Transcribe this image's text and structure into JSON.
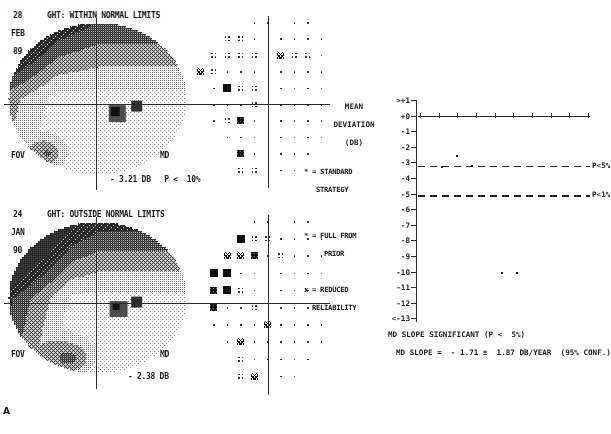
{
  "figure": {
    "panel_label": "A",
    "caption": ""
  },
  "reports": [
    {
      "id": "report-top",
      "day": "28",
      "month": "FEB",
      "year": "89",
      "ght_label": "GHT:",
      "ght_result": "WITHIN NORMAL LIMITS",
      "ght_full": "GHT: WITHIN NORMAL LIMITS",
      "fov_label": "FOV",
      "md_label": "MD",
      "md_value": "- 3.21 DB",
      "md_p": "P <  10%",
      "md_line": "- 3.21 DB   P <  10%"
    },
    {
      "id": "report-bottom",
      "day": "24",
      "month": "JAN",
      "year": "90",
      "ght_label": "GHT:",
      "ght_result": "OUTSIDE NORMAL LIMITS",
      "ght_full": "GHT: OUTSIDE NORMAL LIMITS",
      "fov_label": "FOV",
      "md_label": "MD",
      "md_value": "- 2.38 DB",
      "md_p": "",
      "md_line": "- 2.38 DB"
    }
  ],
  "legend": {
    "items": [
      {
        "symbol": "*",
        "text": "* = STANDARD",
        "text2": "STRATEGY"
      },
      {
        "symbol": "*",
        "text": "* = FULL FROM",
        "text2": "PRIOR"
      },
      {
        "symbol": "x",
        "text": "x = REDUCED",
        "text2": "RELIABILITY"
      }
    ]
  },
  "chart_data": {
    "type": "scatter",
    "title": "MEAN DEVIATION (DB)",
    "title_lines": [
      "MEAN",
      "DEVIATION",
      "(DB)"
    ],
    "ylabel": "MEAN DEVIATION (DB)",
    "xlabel": "",
    "ytick_labels": [
      ">+1",
      "+0",
      "-1",
      "-2",
      "-3",
      "-4",
      "-5",
      "-6",
      "-7",
      "-8",
      "-9",
      "-10",
      "-11",
      "-12",
      "<-13"
    ],
    "ylim": [
      -13,
      1
    ],
    "grid": false,
    "legend_position": "right",
    "reference_lines": [
      {
        "label": "P<5%",
        "value": -3.2,
        "style": "dashed"
      },
      {
        "label": "P<1%",
        "value": -5.1,
        "style": "dashed"
      }
    ],
    "baseline": {
      "label": "",
      "value": 0,
      "style": "solid-with-ticks",
      "tick_count": 10
    },
    "series": [
      {
        "name": "mean deviation",
        "points": [
          {
            "x": 1,
            "y": -3.2
          },
          {
            "x": 2,
            "y": -2.5
          },
          {
            "x": 3,
            "y": -3.15
          },
          {
            "x": 5,
            "y": -10.0
          },
          {
            "x": 6,
            "y": -10.0
          }
        ]
      }
    ],
    "annotations": [
      "MD SLOPE SIGNIFICANT (P <  5%)",
      "MD SLOPE =  - 1.71 ±  1.87 DB/YEAR  (95% CONF.)"
    ],
    "slope_significance": "MD SLOPE SIGNIFICANT (P <  5%)",
    "slope_value": "MD SLOPE =  - 1.71 ±  1.87 DB/YEAR  (95% CONF.)"
  }
}
